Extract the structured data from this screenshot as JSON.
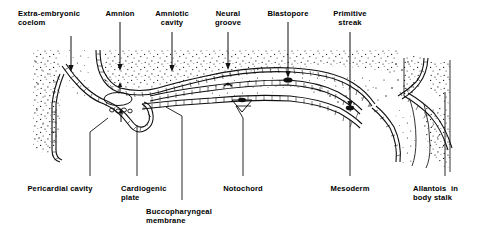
{
  "figure": {
    "kind": "embryology-sagittal-section-diagram",
    "ink_color": "#000000",
    "background_color": "#ffffff"
  },
  "labels": {
    "top": [
      {
        "id": "extra-embryonic-coelom",
        "line1": "Extra-embryonic",
        "line2": "coelom",
        "align": "left",
        "x": 18,
        "y": 9,
        "leader_x": 71,
        "leader_y1": 36,
        "leader_y2": 72,
        "arrow": true
      },
      {
        "id": "amnion",
        "line1": "Amnion",
        "line2": "",
        "align": "center",
        "x": 120,
        "y": 9,
        "leader_x": 120,
        "leader_y1": 22,
        "leader_y2": 71,
        "arrow": true
      },
      {
        "id": "amniotic-cavity",
        "line1": "Amniotic",
        "line2": "cavity",
        "align": "center",
        "x": 172,
        "y": 9,
        "leader_x": 172,
        "leader_y1": 32,
        "leader_y2": 72,
        "arrow": true
      },
      {
        "id": "neural-groove",
        "line1": "Neural",
        "line2": "groove",
        "align": "center",
        "x": 228,
        "y": 9,
        "leader_x": 228,
        "leader_y1": 32,
        "leader_y2": 70,
        "arrow": true
      },
      {
        "id": "blastopore",
        "line1": "Blastopore",
        "line2": "",
        "align": "center",
        "x": 288,
        "y": 9,
        "leader_x": 288,
        "leader_y1": 22,
        "leader_y2": 78,
        "arrow": true
      },
      {
        "id": "primitive-streak",
        "line1": "Primitive",
        "line2": "streak",
        "align": "center",
        "x": 350,
        "y": 9,
        "leader_x": 350,
        "leader_y1": 32,
        "leader_y2": 108,
        "arrow": true
      }
    ],
    "bottom": [
      {
        "id": "pericardial-cavity",
        "line1": "Pericardial cavity",
        "line2": "",
        "align": "center",
        "x": 60,
        "y": 184
      },
      {
        "id": "cardiogenic-plate",
        "line1": "Cardiogenic",
        "line2": "plate",
        "align": "left",
        "x": 121,
        "y": 184
      },
      {
        "id": "buccopharyngeal-membrane",
        "line1": "Buccopharyngeal",
        "line2": "membrane",
        "align": "left",
        "x": 146,
        "y": 207
      },
      {
        "id": "notochord",
        "line1": "Notochord",
        "line2": "",
        "align": "center",
        "x": 243,
        "y": 184
      },
      {
        "id": "mesoderm",
        "line1": "Mesoderm",
        "line2": "",
        "align": "center",
        "x": 350,
        "y": 184
      },
      {
        "id": "allantois-in-body-stalk",
        "line1": "Allantois  in",
        "line2": "body stalk",
        "align": "left",
        "x": 413,
        "y": 184
      }
    ]
  },
  "leaders_bottom": [
    {
      "id": "leader-pericardial-cavity",
      "points": "90,176 90,132 108,118"
    },
    {
      "id": "leader-cardiogenic-plate",
      "points": "137,176 137,125"
    },
    {
      "id": "leader-buccopharyngeal-membrane",
      "points": "182,200 182,116 166,107"
    },
    {
      "id": "leader-notochord",
      "points": "243,176 243,118 236,106 251,106"
    },
    {
      "id": "leader-mesoderm",
      "points": "350,176 350,120"
    },
    {
      "id": "leader-allantois",
      "points": "445,176 445,92"
    }
  ]
}
